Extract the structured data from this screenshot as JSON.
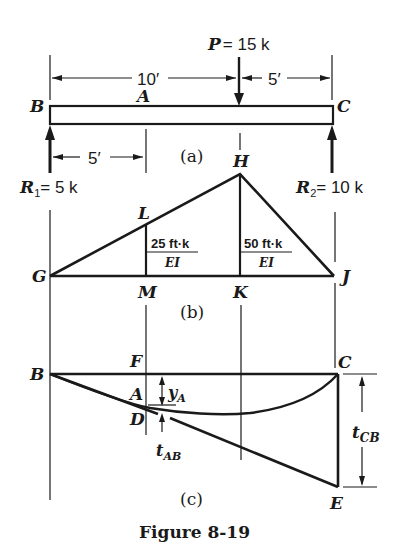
{
  "figure": {
    "caption": "Figure 8-19",
    "parts": {
      "a": "(a)",
      "b": "(b)",
      "c": "(c)"
    }
  },
  "beam": {
    "load_label_P": "P",
    "load_value": "= 15 k",
    "dim_total_left": "10′",
    "dim_right": "5′",
    "dim_to_A": "5′",
    "points": {
      "B": "B",
      "A": "A",
      "C": "C",
      "H": "H"
    },
    "reaction_1_label": "R",
    "reaction_1_sub": "1",
    "reaction_1_value": "= 5 k",
    "reaction_2_label": "R",
    "reaction_2_sub": "2",
    "reaction_2_value": "= 10 k"
  },
  "moment_diagram": {
    "points": {
      "G": "G",
      "L": "L",
      "H": "H",
      "M": "M",
      "K": "K",
      "J": "J"
    },
    "ordinate_LM_num": "25 ft·k",
    "ordinate_LM_den": "EI",
    "ordinate_HK_num": "50 ft·k",
    "ordinate_HK_den": "EI"
  },
  "elastic_curve": {
    "points": {
      "B": "B",
      "F": "F",
      "A": "A",
      "D": "D",
      "C": "C",
      "E": "E"
    },
    "y_A": "y",
    "y_A_sub": "A",
    "t_AB": "t",
    "t_AB_sub": "AB",
    "t_CB": "t",
    "t_CB_sub": "CB"
  }
}
